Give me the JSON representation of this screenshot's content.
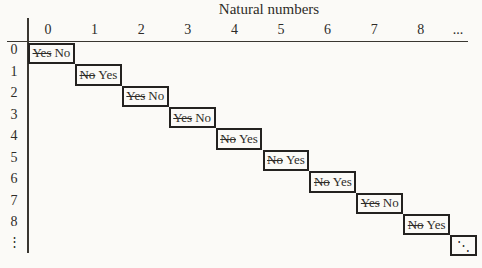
{
  "title": "Natural numbers",
  "column_headers": [
    "0",
    "1",
    "2",
    "3",
    "4",
    "5",
    "6",
    "7",
    "8",
    "..."
  ],
  "row_headers": [
    "0",
    "1",
    "2",
    "3",
    "4",
    "5",
    "6",
    "7",
    "8",
    "⋮"
  ],
  "diagonal_cells": [
    {
      "struck": "Yes",
      "kept": "No"
    },
    {
      "struck": "No",
      "kept": "Yes"
    },
    {
      "struck": "Yes",
      "kept": "No"
    },
    {
      "struck": "Yes",
      "kept": "No"
    },
    {
      "struck": "No",
      "kept": "Yes"
    },
    {
      "struck": "No",
      "kept": "Yes"
    },
    {
      "struck": "No",
      "kept": "Yes"
    },
    {
      "struck": "Yes",
      "kept": "No"
    },
    {
      "struck": "No",
      "kept": "Yes"
    }
  ],
  "corner_ellipsis": "⋱",
  "colors": {
    "ink": "#2e2c28",
    "line": "#3a3731",
    "box_border": "#242220",
    "background": "#fbfaf7"
  }
}
